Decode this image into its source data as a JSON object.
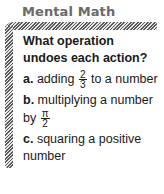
{
  "box": {
    "title": "Mental Math",
    "question": "What operation undoes each action?",
    "items": [
      {
        "letter": "a.",
        "before": "adding ",
        "frac_num": "2",
        "frac_den": "3",
        "after": " to a number"
      },
      {
        "letter": "b.",
        "before": "multiplying a number by ",
        "frac_num": "π",
        "frac_den": "2",
        "after": ""
      },
      {
        "letter": "c.",
        "before": "squaring a positive number",
        "frac_num": "",
        "frac_den": "",
        "after": ""
      }
    ]
  },
  "colors": {
    "title": "#6a6a6a",
    "hatch": "#5a5a5a",
    "text": "#1a1a1a"
  }
}
